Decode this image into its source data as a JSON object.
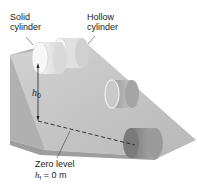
{
  "labels": {
    "solid_cylinder": "Solid\ncylinder",
    "hollow_cylinder": "Hollow\ncylinder",
    "initial_height": "h",
    "initial_height_sub": "0",
    "zero_level_line1": "Zero level",
    "zero_level_h": "h",
    "zero_level_sub": "f",
    "zero_level_value": " = 0 m"
  },
  "colors": {
    "ramp_slope": "#c8c8c8",
    "ramp_side": "#a9a9a9",
    "cylinder_light": "#ececec",
    "cylinder_dark": "#8a8a8a",
    "dashed_line": "#222222"
  }
}
